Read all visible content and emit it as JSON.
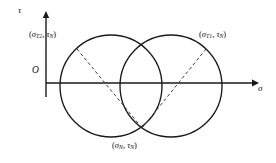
{
  "figure": {
    "type": "mohr-circle-diagram",
    "axes": {
      "vertical_label": "τ",
      "horizontal_label": "σ",
      "origin_label": "O",
      "origin_px": {
        "x": 46,
        "y": 83
      },
      "horizontal_axis_y": 83,
      "vertical_axis_x": 46,
      "horizontal_axis_end_x": 256,
      "vertical_axis_top_y": 14
    },
    "circles": [
      {
        "name": "left-circle",
        "cx": 111,
        "cy": 86,
        "r": 51
      },
      {
        "name": "right-circle",
        "cx": 171,
        "cy": 86,
        "r": 51
      }
    ],
    "dashed_lines": [
      {
        "name": "left-chord",
        "x1": 77,
        "y1": 49,
        "x2": 142,
        "y2": 128
      },
      {
        "name": "right-chord",
        "x1": 206,
        "y1": 49,
        "x2": 142,
        "y2": 128
      }
    ],
    "intersection_points": [
      {
        "name": "upper-intersection",
        "x": 141,
        "y": 44
      },
      {
        "name": "lower-intersection",
        "x": 141,
        "y": 128
      }
    ],
    "labels": {
      "left_point": {
        "open": "(",
        "sym1": "σ",
        "sub1": "T2",
        "comma": ", ",
        "sym2": "τ",
        "sub2": "N",
        "close": ")",
        "text": "(σT2, τN)"
      },
      "right_point": {
        "open": "(",
        "sym1": "σ",
        "sub1": "T1",
        "comma": ", ",
        "sym2": "τ",
        "sub2": "N",
        "close": ")",
        "text": "(σT1, τN)"
      },
      "bottom_point": {
        "open": "(",
        "sym1": "σ",
        "sub1": "N",
        "comma": ", ",
        "sym2": "τ",
        "sub2": "N",
        "close": ")",
        "text": "(σN, τN)"
      }
    },
    "colors": {
      "stroke": "#1a1a1a",
      "dashed_stroke": "#4a4a4a",
      "background": "#ffffff",
      "text": "#121212"
    }
  }
}
